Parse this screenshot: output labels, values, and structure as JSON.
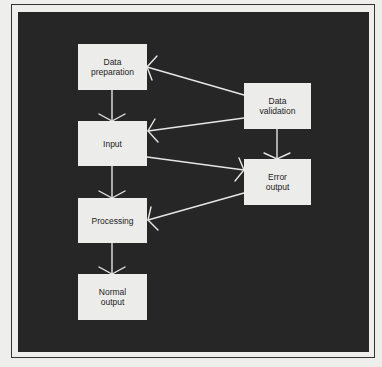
{
  "diagram": {
    "colors": {
      "page_background": "#eeeeec",
      "panel_background": "#262626",
      "node_fill": "#ececea",
      "node_text": "#222222",
      "connector": "#e6e6e6",
      "frame": "#333333"
    },
    "nodes": [
      {
        "id": "data-preparation",
        "label": "Data\npreparation",
        "x": 78,
        "y": 44,
        "w": 69,
        "h": 46
      },
      {
        "id": "input",
        "label": "Input",
        "x": 78,
        "y": 121,
        "w": 69,
        "h": 45
      },
      {
        "id": "processing",
        "label": "Processing",
        "x": 78,
        "y": 198,
        "w": 69,
        "h": 45
      },
      {
        "id": "normal-output",
        "label": "Normal\noutput",
        "x": 78,
        "y": 274,
        "w": 69,
        "h": 46
      },
      {
        "id": "data-validation",
        "label": "Data\nvalidation",
        "x": 244,
        "y": 83,
        "w": 67,
        "h": 46
      },
      {
        "id": "error-output",
        "label": "Error\noutput",
        "x": 244,
        "y": 159,
        "w": 67,
        "h": 46
      }
    ],
    "edges": [
      {
        "from": "data-preparation",
        "to": "input"
      },
      {
        "from": "input",
        "to": "processing"
      },
      {
        "from": "processing",
        "to": "normal-output"
      },
      {
        "from": "data-validation",
        "to": "error-output"
      },
      {
        "from": "data-validation",
        "to": "data-preparation"
      },
      {
        "from": "data-validation",
        "to": "input"
      },
      {
        "from": "input",
        "to": "error-output"
      },
      {
        "from": "error-output",
        "to": "processing"
      }
    ]
  }
}
